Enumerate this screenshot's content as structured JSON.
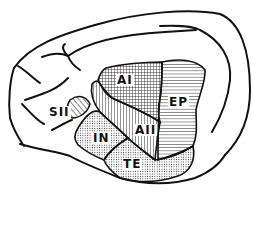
{
  "diagram": {
    "colors": {
      "ink": "#111111",
      "background": "#ffffff"
    },
    "regions": [
      {
        "id": "AI",
        "label": "AI",
        "pattern": "crosshatch-grid"
      },
      {
        "id": "AII",
        "label": "AII",
        "pattern": "vertical-lines"
      },
      {
        "id": "EP",
        "label": "EP",
        "pattern": "horizontal-lines"
      },
      {
        "id": "SII",
        "label": "SII",
        "pattern": "diagonal-lines"
      },
      {
        "id": "IN",
        "label": "IN",
        "pattern": "stipple"
      },
      {
        "id": "TE",
        "label": "TE",
        "pattern": "stipple"
      }
    ]
  }
}
